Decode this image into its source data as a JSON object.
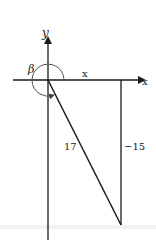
{
  "diagram": {
    "type": "coordinate-triangle",
    "axes": {
      "x_label": "x",
      "y_label": "y"
    },
    "angle_label": "β",
    "triangle": {
      "horizontal_side_label": "x",
      "hypotenuse_label": "17",
      "vertical_side_label": "−15"
    },
    "colors": {
      "stroke": "#1a1a1a",
      "background": "#ffffff"
    }
  }
}
